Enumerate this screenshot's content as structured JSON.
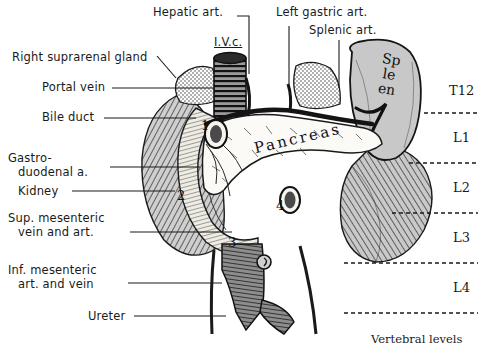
{
  "figure": {
    "background_color": "#ffffff",
    "ink_color": "#1a1a1a",
    "width": 482,
    "height": 355
  },
  "labels_left": [
    {
      "text": "Right suprarenal gland",
      "x": 12,
      "y": 51
    },
    {
      "text": "Portal vein",
      "x": 42,
      "y": 87
    },
    {
      "text": "Bile duct",
      "x": 42,
      "y": 117
    },
    {
      "text": "Gastro-",
      "x": 8,
      "y": 152
    },
    {
      "text": "duodenal a.",
      "x": 18,
      "y": 166
    },
    {
      "text": "Kidney",
      "x": 18,
      "y": 191
    },
    {
      "text": "Sup. mesenteric",
      "x": 8,
      "y": 218
    },
    {
      "text": "vein and art.",
      "x": 18,
      "y": 232
    },
    {
      "text": "Inf. mesenteric",
      "x": 8,
      "y": 268
    },
    {
      "text": "art. and vein",
      "x": 18,
      "y": 282
    },
    {
      "text": "Ureter",
      "x": 88,
      "y": 315
    }
  ],
  "labels_top": [
    {
      "text": "Hepatic art.",
      "x": 153,
      "y": 10
    },
    {
      "text": "Left gastric art.",
      "x": 276,
      "y": 10
    },
    {
      "text": "Splenic art.",
      "x": 309,
      "y": 28
    }
  ],
  "labels_inline": [
    {
      "text": "I.V.c.",
      "x": 214,
      "y": 42
    },
    {
      "text": "Pancreas",
      "x": 232,
      "y": 140
    },
    {
      "text": "Spleen",
      "x": 383,
      "y": 60
    }
  ],
  "number_markers": [
    {
      "text": "1",
      "x": 201,
      "y": 126
    },
    {
      "text": "2",
      "x": 177,
      "y": 196
    },
    {
      "text": "3",
      "x": 228,
      "y": 243
    },
    {
      "text": "4",
      "x": 276,
      "y": 206
    }
  ],
  "vertebral_levels": [
    {
      "text": "T12",
      "x": 449,
      "y": 91
    },
    {
      "text": "L1",
      "x": 453,
      "y": 138
    },
    {
      "text": "L2",
      "x": 453,
      "y": 188
    },
    {
      "text": "L3",
      "x": 453,
      "y": 238
    },
    {
      "text": "L4",
      "x": 453,
      "y": 288
    }
  ],
  "vertebral_caption": {
    "text": "Vertebral levels",
    "x": 371,
    "y": 338
  },
  "vertebral_dashed_lines": [
    {
      "y": 113,
      "x1": 424,
      "x2": 478
    },
    {
      "y": 163,
      "x1": 409,
      "x2": 478
    },
    {
      "y": 213,
      "x1": 392,
      "x2": 478
    },
    {
      "y": 263,
      "x1": 344,
      "x2": 478
    },
    {
      "y": 313,
      "x1": 344,
      "x2": 478
    }
  ],
  "leader_lines": [
    {
      "name": "right-suprarenal-gland",
      "points": "157,56 176,78"
    },
    {
      "name": "portal-vein",
      "points": "112,88 215,88"
    },
    {
      "name": "bile-duct",
      "points": "104,118 196,118"
    },
    {
      "name": "gastroduodenal-a",
      "points": "110,167 200,167"
    },
    {
      "name": "kidney",
      "points": "72,191 175,191"
    },
    {
      "name": "sup-mesenteric",
      "points": "130,232 232,232"
    },
    {
      "name": "inf-mesenteric",
      "points": "128,283 222,283"
    },
    {
      "name": "ureter",
      "points": "134,316 226,316"
    },
    {
      "name": "hepatic-art",
      "points": "237,16 249,16 249,74"
    },
    {
      "name": "left-gastric-art",
      "points": "289,26 289,84"
    },
    {
      "name": "splenic-art",
      "points": "339,40 339,88"
    }
  ]
}
